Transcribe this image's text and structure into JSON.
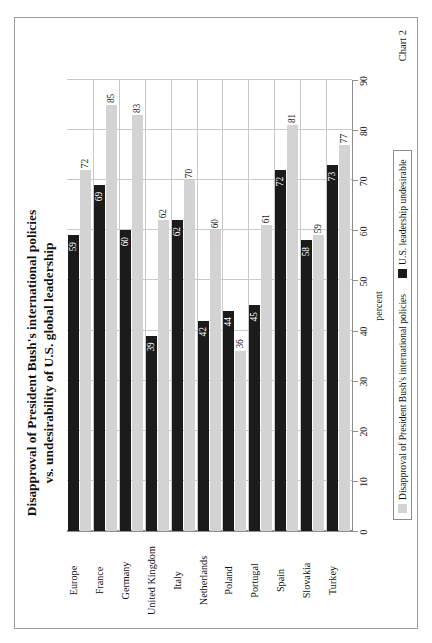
{
  "page": {
    "caption": "Chart 2"
  },
  "chart_data": {
    "type": "bar",
    "orientation": "horizontal",
    "title": "Disapproval of President Bush's international policies vs. undesirability of U.S. global leadership",
    "title_line1": "Disapproval of President Bush's international policies",
    "title_line2": "vs. undesirability of U.S. global leadership",
    "xlabel": "percent",
    "ylabel": "",
    "xlim": [
      0,
      90
    ],
    "xticks": [
      0,
      10,
      20,
      30,
      40,
      50,
      60,
      70,
      80,
      90
    ],
    "xticklabels": [
      "0",
      "10",
      "20",
      "30",
      "40",
      "50",
      "60",
      "70",
      "80",
      "90"
    ],
    "grid": true,
    "legend_position": "bottom",
    "categories": [
      "Europe",
      "France",
      "Germany",
      "United Kingdom",
      "Italy",
      "Netherlands",
      "Poland",
      "Portugal",
      "Spain",
      "Slovakia",
      "Turkey"
    ],
    "series": [
      {
        "name": "Disapproval of President Bush's international policies",
        "color": "#d3d3d3",
        "values": [
          72,
          85,
          83,
          62,
          70,
          60,
          36,
          61,
          81,
          59,
          77
        ]
      },
      {
        "name": "U.S. leadership undesirable",
        "color": "#1b1b1b",
        "values": [
          59,
          69,
          60,
          39,
          62,
          42,
          44,
          45,
          72,
          58,
          73
        ]
      }
    ]
  },
  "colors": {
    "series_gray": "#d3d3d3",
    "series_black": "#1b1b1b",
    "grid": "#c9c9c9",
    "axis": "#8d8d8d",
    "frame": "#9a9a9a"
  }
}
